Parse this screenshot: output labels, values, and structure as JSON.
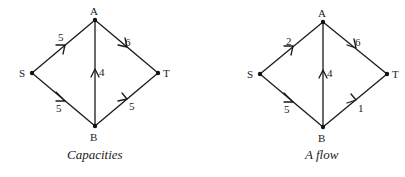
{
  "figure": {
    "graphs": [
      {
        "caption": "Capacities",
        "nodes": {
          "S": {
            "label": "S",
            "x": 32,
            "y": 73
          },
          "A": {
            "label": "A",
            "x": 95,
            "y": 20
          },
          "T": {
            "label": "T",
            "x": 158,
            "y": 73
          },
          "B": {
            "label": "B",
            "x": 95,
            "y": 126
          }
        },
        "edges": [
          {
            "from": "S",
            "to": "A",
            "value": "5"
          },
          {
            "from": "A",
            "to": "T",
            "value": "6"
          },
          {
            "from": "S",
            "to": "B",
            "value": "5"
          },
          {
            "from": "B",
            "to": "T",
            "value": "5"
          },
          {
            "from": "B",
            "to": "A",
            "value": "4"
          }
        ]
      },
      {
        "caption": "A flow",
        "nodes": {
          "S": {
            "label": "S",
            "x": 260,
            "y": 74
          },
          "A": {
            "label": "A",
            "x": 323,
            "y": 22
          },
          "T": {
            "label": "T",
            "x": 387,
            "y": 74
          },
          "B": {
            "label": "B",
            "x": 323,
            "y": 127
          }
        },
        "edges": [
          {
            "from": "S",
            "to": "A",
            "value": "2"
          },
          {
            "from": "A",
            "to": "T",
            "value": "6"
          },
          {
            "from": "S",
            "to": "B",
            "value": "5"
          },
          {
            "from": "B",
            "to": "T",
            "value": "1"
          },
          {
            "from": "B",
            "to": "A",
            "value": "4"
          }
        ]
      }
    ]
  }
}
